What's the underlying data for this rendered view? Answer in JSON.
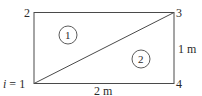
{
  "diagram": {
    "type": "finite-element-mesh",
    "rectangle": {
      "width_label": "2 m",
      "height_label": "1 m"
    },
    "nodes": [
      {
        "id": "1",
        "label_prefix": "i = ",
        "label": "1",
        "position": "bottom-left"
      },
      {
        "id": "2",
        "label": "2",
        "position": "top-left"
      },
      {
        "id": "3",
        "label": "3",
        "position": "top-right"
      },
      {
        "id": "4",
        "label": "4",
        "position": "bottom-right"
      }
    ],
    "elements": [
      {
        "id": "1",
        "label": "1",
        "nodes": [
          "1",
          "3",
          "2"
        ]
      },
      {
        "id": "2",
        "label": "2",
        "nodes": [
          "1",
          "4",
          "3"
        ]
      }
    ],
    "dimensions": {
      "horizontal": "2 m",
      "vertical": "1 m"
    },
    "colors": {
      "line": "#4a4a4a",
      "text": "#2a2a2a",
      "background": "#ffffff"
    }
  }
}
